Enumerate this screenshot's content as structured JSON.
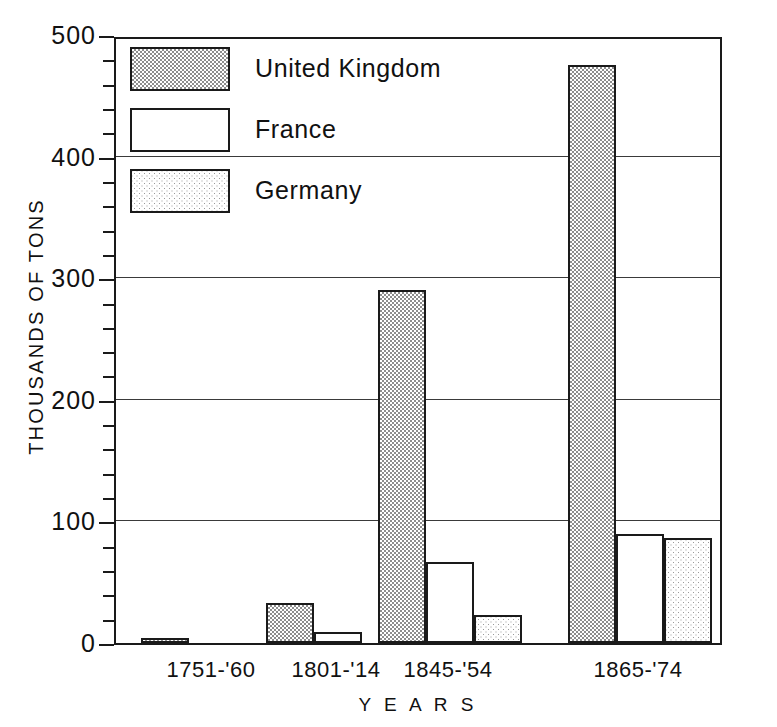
{
  "chart_data": {
    "type": "bar",
    "title": "",
    "subtitle": "",
    "xlabel": "Y E A R S",
    "ylabel": "THOUSANDS OF TONS",
    "categories": [
      "1751-'60",
      "1801-'14",
      "1845-'54",
      "1865-'74"
    ],
    "series": [
      {
        "name": "United Kingdom",
        "values": [
          4,
          33,
          290,
          475
        ],
        "fill": "checkerboard-gray",
        "color": "#8d8d8d"
      },
      {
        "name": "France",
        "values": [
          0,
          9,
          67,
          90
        ],
        "fill": "white",
        "color": "#ffffff"
      },
      {
        "name": "Germany",
        "values": [
          0,
          0,
          23,
          86
        ],
        "fill": "dotted-gray",
        "color": "#9a9a9a"
      }
    ],
    "ylim": [
      0,
      500
    ],
    "y_major_ticks": [
      0,
      100,
      200,
      300,
      400,
      500
    ],
    "y_minor_tick_step": 20,
    "grid": "horizontal",
    "legend_position": "top-left-inside",
    "axis_color": "#1a1a1a",
    "background": "#ffffff"
  },
  "legend": {
    "items": [
      {
        "label": "United Kingdom",
        "swatch": "checkerboard-gray"
      },
      {
        "label": "France",
        "swatch": "white"
      },
      {
        "label": "Germany",
        "swatch": "dotted-gray"
      }
    ]
  },
  "axes": {
    "y_tick_labels": [
      "500",
      "400",
      "300",
      "200",
      "100",
      "0"
    ],
    "y_title": "THOUSANDS OF TONS",
    "x_title": "Y E A R S",
    "x_tick_labels": [
      "1751-'60",
      "1801-'14",
      "1845-'54",
      "1865-'74"
    ]
  }
}
